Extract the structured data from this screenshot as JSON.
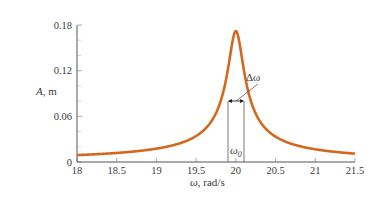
{
  "chart_data": {
    "type": "line",
    "title": "",
    "xlabel": "ω, rad/s",
    "ylabel": "A, m",
    "xlim": [
      18,
      21.5
    ],
    "ylim": [
      0,
      0.18
    ],
    "grid": false,
    "legend": null,
    "x_ticks": [
      "18",
      "18.5",
      "19",
      "19.5",
      "20",
      "20.5",
      "21",
      "21.5"
    ],
    "y_ticks": [
      "0",
      "0.06",
      "0.12",
      "0.18"
    ],
    "series": [
      {
        "name": "resonance curve",
        "color": "#d2691e",
        "x": [
          18.0,
          18.5,
          19.0,
          19.5,
          19.7,
          19.8,
          19.9,
          19.95,
          20.0,
          20.05,
          20.1,
          20.2,
          20.3,
          20.5,
          21.0,
          21.5
        ],
        "values": [
          0.004,
          0.005,
          0.008,
          0.016,
          0.027,
          0.043,
          0.085,
          0.13,
          0.172,
          0.13,
          0.085,
          0.043,
          0.027,
          0.016,
          0.008,
          0.005
        ]
      }
    ],
    "annotations": [
      {
        "text": "Δω",
        "description": "full width at half max, between ω≈19.9 and ω≈20.1"
      },
      {
        "text": "ω0",
        "description": "resonance frequency ω0 = 20 rad/s"
      }
    ]
  },
  "labels": {
    "ylabel_italic": "A",
    "ylabel_rest": ", m",
    "xlabel_italic": "ω",
    "xlabel_rest": ", rad/s",
    "delta_omega": "Δω",
    "omega": "ω",
    "omega_sub": "0"
  }
}
